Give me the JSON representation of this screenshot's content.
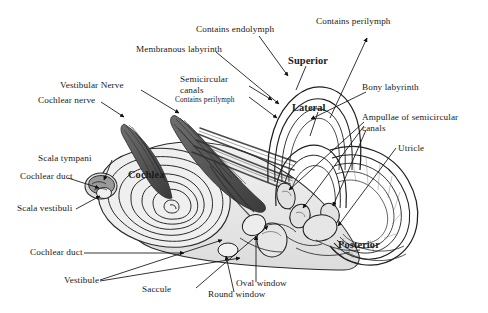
{
  "figure": {
    "background_color": "#ffffff",
    "ink_color": "#1a1a1a",
    "fill_light": "#e8e8e8",
    "fill_mid": "#cfcfcf",
    "fill_dark": "#8a8a8a",
    "nerve_color": "#4a4a4a"
  },
  "labels": {
    "contains_endolymph": "Contains endolymph",
    "contains_perilymph_top": "Contains perilymph",
    "membranous_labyrinth": "Membranous labyrinth",
    "superior": "Superior",
    "bony_labyrinth": "Bony labyrinth",
    "vestibular_nerve": "Vestibular Nerve",
    "cochlear_nerve": "Cochlear nerve",
    "semicircular_canals_line1": "Semicircular",
    "semicircular_canals_line2": "canals",
    "semicircular_contains_perilymph": "Contains perilymph",
    "lateral": "Lateral",
    "ampullae_line1": "Ampullae of semicircular",
    "ampullae_line2": "canals",
    "utricle": "Utricle",
    "scala_tympani": "Scala tympani",
    "cochlear_duct_upper": "Cochlear duct",
    "scala_vestibuli": "Scala vestibuli",
    "cochlea": "Cochlea",
    "cochlear_duct_lower": "Cochlear duct",
    "vestibule": "Vestibule",
    "saccule": "Saccule",
    "oval_window": "Oval window",
    "round_window": "Round window",
    "posterior": "Posterior"
  }
}
